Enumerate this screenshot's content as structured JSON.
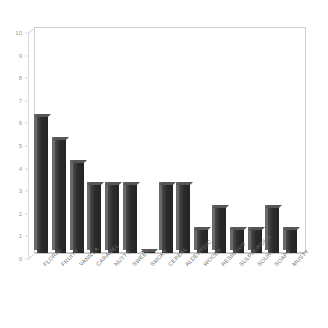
{
  "chart_data": {
    "type": "bar",
    "title": "",
    "subtitle": "",
    "xlabel": "",
    "ylabel": "",
    "ylim": [
      0,
      10
    ],
    "yticks": [
      10,
      9,
      8,
      7,
      6,
      5,
      4,
      3,
      2,
      1,
      0
    ],
    "grid": false,
    "legend": false,
    "legend_position": "none",
    "style": "3d-column",
    "bar_color": "#2e2e2e",
    "bar_side_color": "#6a6a6a",
    "bar_top_color": "#565656",
    "frame_color": "#cfcfcf",
    "tick_label_color": "#9a9a9a",
    "category_label_color": "#6f6f6f",
    "category_label_rotation": -45,
    "categories": [
      "FLORAL",
      "FRUITY",
      "VANILLA",
      "CARAMEL",
      "NUTTY",
      "SWEET",
      "SMOKY",
      "CEREAL",
      "ALDEHYDIC",
      "WOODY",
      "RESINOUS",
      "SULPHUROUS",
      "SOUR",
      "SOAPY",
      "MUSTY"
    ],
    "values": [
      6,
      5,
      4,
      3,
      3,
      3,
      0,
      3,
      3,
      1,
      2,
      1,
      1,
      2,
      1
    ]
  }
}
